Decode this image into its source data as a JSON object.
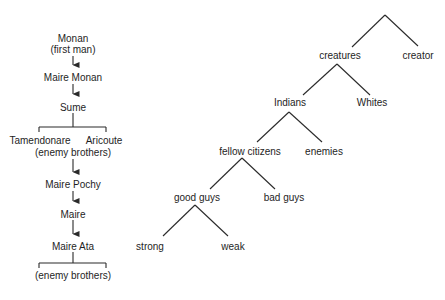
{
  "genealogy": {
    "nodes": [
      {
        "id": "monan",
        "label": "Monan",
        "x": 73,
        "y": 38
      },
      {
        "id": "monan-sub",
        "label": "(first man)",
        "x": 73,
        "y": 49
      },
      {
        "id": "maire-monan",
        "label": "Maire Monan",
        "x": 73,
        "y": 77
      },
      {
        "id": "sume",
        "label": "Sume",
        "x": 73,
        "y": 107
      },
      {
        "id": "tamendonare",
        "label": "Tamendonare",
        "x": 40,
        "y": 140
      },
      {
        "id": "aricoute",
        "label": "Aricoute",
        "x": 104,
        "y": 140
      },
      {
        "id": "enemy-brothers-1",
        "label": "(enemy brothers)",
        "x": 73,
        "y": 152
      },
      {
        "id": "maire-pochy",
        "label": "Maire Pochy",
        "x": 73,
        "y": 184
      },
      {
        "id": "maire",
        "label": "Maire",
        "x": 73,
        "y": 214
      },
      {
        "id": "maire-ata",
        "label": "Maire Ata",
        "x": 73,
        "y": 246
      },
      {
        "id": "enemy-brothers-2",
        "label": "(enemy brothers)",
        "x": 73,
        "y": 275
      }
    ],
    "arrows": [
      {
        "from": "monan",
        "to": "maire-monan",
        "x": 73,
        "y1": 56,
        "y2": 71
      },
      {
        "from": "maire-monan",
        "to": "sume",
        "x": 73,
        "y1": 84,
        "y2": 100
      },
      {
        "from": "enemy-brothers-1",
        "to": "maire-pochy",
        "x": 73,
        "y1": 159,
        "y2": 178
      },
      {
        "from": "maire-pochy",
        "to": "maire",
        "x": 73,
        "y1": 191,
        "y2": 207
      },
      {
        "from": "maire",
        "to": "maire-ata",
        "x": 73,
        "y1": 220,
        "y2": 240
      }
    ],
    "brackets": [
      {
        "parent": "sume",
        "x_center": 73,
        "y_top": 113,
        "y_bar": 127,
        "x_left": 39,
        "x_right": 106,
        "y_tick": 132
      },
      {
        "parent": "maire-ata",
        "x_center": 73,
        "y_top": 252,
        "y_bar": 263,
        "x_left": 39,
        "x_right": 106,
        "y_tick": 268
      }
    ]
  },
  "binary_tree": {
    "nodes": [
      {
        "id": "creatures",
        "label": "creatures",
        "x": 340,
        "y": 55
      },
      {
        "id": "creator",
        "label": "creator",
        "x": 418,
        "y": 55
      },
      {
        "id": "indians",
        "label": "Indians",
        "x": 290,
        "y": 102
      },
      {
        "id": "whites",
        "label": "Whites",
        "x": 372,
        "y": 102
      },
      {
        "id": "fellow-citizens",
        "label": "fellow citizens",
        "x": 250,
        "y": 151
      },
      {
        "id": "enemies",
        "label": "enemies",
        "x": 324,
        "y": 151
      },
      {
        "id": "good-guys",
        "label": "good guys",
        "x": 197,
        "y": 197
      },
      {
        "id": "bad-guys",
        "label": "bad guys",
        "x": 284,
        "y": 197
      },
      {
        "id": "strong",
        "label": "strong",
        "x": 150,
        "y": 246
      },
      {
        "id": "weak",
        "label": "weak",
        "x": 233,
        "y": 246
      }
    ],
    "branches": [
      {
        "apex": [
          385,
          15
        ],
        "left": [
          352,
          47
        ],
        "right": [
          418,
          46
        ]
      },
      {
        "apex": [
          337,
          64
        ],
        "left": [
          303,
          95
        ],
        "right": [
          370,
          95
        ]
      },
      {
        "apex": [
          289,
          112
        ],
        "left": [
          257,
          142
        ],
        "right": [
          322,
          142
        ]
      },
      {
        "apex": [
          242,
          158
        ],
        "left": [
          210,
          189
        ],
        "right": [
          275,
          189
        ]
      },
      {
        "apex": [
          195,
          205
        ],
        "left": [
          163,
          236
        ],
        "right": [
          228,
          236
        ]
      }
    ]
  },
  "colors": {
    "line": "#2a2a2a",
    "text": "#1e1e1e",
    "background": "#ffffff"
  }
}
